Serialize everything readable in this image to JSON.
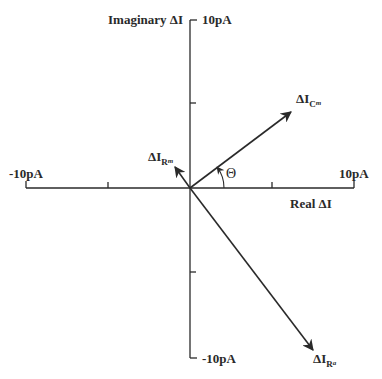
{
  "diagram": {
    "type": "phasor",
    "axes": {
      "imaginary_label": "Imaginary ΔI",
      "real_label": "Real ΔI",
      "y_max_label": "10pA",
      "y_min_label": "-10pA",
      "x_max_label": "10pA",
      "x_min_label": "-10pA"
    },
    "angle_label": "Θ",
    "vectors": [
      {
        "name": "ΔI",
        "subscript": "C",
        "subsubscript": "m",
        "direction": "upper-right"
      },
      {
        "name": "ΔI",
        "subscript": "R",
        "subsubscript": "m",
        "direction": "upper-left"
      },
      {
        "name": "ΔI",
        "subscript": "R",
        "subsubscript": "a",
        "direction": "lower-right"
      }
    ]
  }
}
